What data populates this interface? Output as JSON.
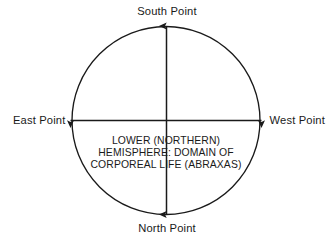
{
  "diagram": {
    "background_color": "#ffffff",
    "stroke_color": "#1a1a1a",
    "text_color": "#1a1a1a",
    "circle": {
      "center_x": 166,
      "center_y": 120.5,
      "radius": 94
    },
    "cardinal_labels": {
      "south": "South Point",
      "north": "North Point",
      "east": "East Point",
      "west": "West Point"
    },
    "axes": [
      {
        "name": "vertical-axis",
        "orientation": "vertical",
        "from_label": "South Point",
        "to_label": "North Point",
        "arrowheads": "both"
      },
      {
        "name": "horizontal-axis",
        "orientation": "horizontal",
        "from_label": "East Point",
        "to_label": "West Point",
        "arrowheads": "both"
      }
    ],
    "center_caption": {
      "line1": "LOWER (NORTHERN)",
      "line2": "HEMISPHERE: DOMAIN OF",
      "line3": "CORPOREAL LIFE (ABRAXAS)"
    }
  }
}
